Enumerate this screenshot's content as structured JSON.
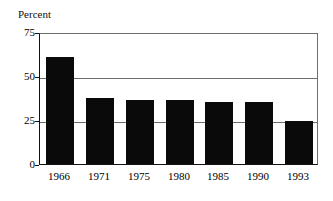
{
  "chart_data": {
    "type": "bar",
    "title": "",
    "subtitle": "",
    "xlabel": "",
    "ylabel": "Percent",
    "categories": [
      "1966",
      "1971",
      "1975",
      "1980",
      "1985",
      "1990",
      "1993"
    ],
    "values": [
      61,
      37.5,
      36.5,
      36.5,
      35.5,
      35.5,
      24.5
    ],
    "series": [
      {
        "name": "Percent",
        "values": [
          61,
          37.5,
          36.5,
          36.5,
          35.5,
          35.5,
          24.5
        ]
      }
    ],
    "ylim": [
      0,
      75
    ],
    "yticks": [
      0,
      25,
      50,
      75
    ],
    "ytick_labels": [
      "0",
      "25",
      "50",
      "75"
    ],
    "grid": true,
    "grid_axis": "y",
    "legend": false,
    "legend_position": "none",
    "bar_color": "#0a0a0a",
    "background_color": "#ffffff",
    "axis_color": "#111111",
    "gridline_color": "#6e6e6e",
    "annotations": []
  },
  "axis": {
    "y_title": "Percent"
  }
}
